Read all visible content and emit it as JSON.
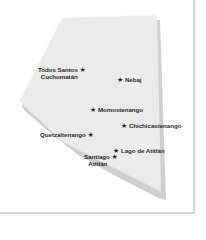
{
  "map": {
    "region_fill": "#ebebeb",
    "shadow_fill": "#cfcfcf",
    "frame_color": "#d6d6d6",
    "marker_icon": "star-icon",
    "marker_glyph": "★",
    "places": [
      {
        "id": "todos-santos",
        "line1": "Todos Santos",
        "line2": "Cuchumatán"
      },
      {
        "id": "nebaj",
        "line1": "Nebaj"
      },
      {
        "id": "momostenango",
        "line1": "Momostenango"
      },
      {
        "id": "chichicastenango",
        "line1": "Chichicastenango"
      },
      {
        "id": "quetzaltenango",
        "line1": "Quetzaltenango"
      },
      {
        "id": "lago-de-atitlan",
        "line1": "Lago de Atitlán"
      },
      {
        "id": "santiago-atitlan",
        "line1": "Santiago",
        "line2": "Atitlán"
      }
    ]
  }
}
